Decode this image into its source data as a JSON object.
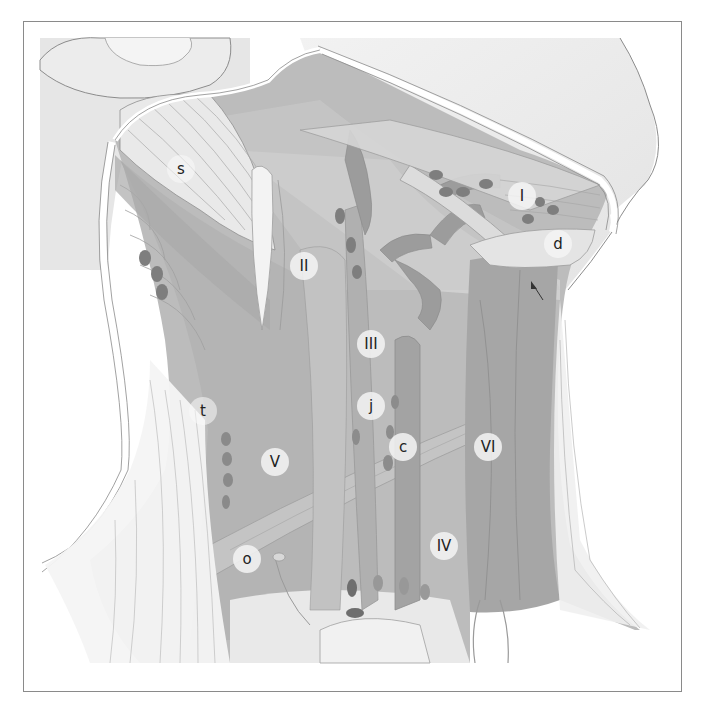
{
  "figure": {
    "labels": [
      {
        "id": "s",
        "text": "s",
        "x": 181,
        "y": 169
      },
      {
        "id": "I",
        "text": "I",
        "x": 522,
        "y": 196
      },
      {
        "id": "d",
        "text": "d",
        "x": 558,
        "y": 244
      },
      {
        "id": "II",
        "text": "II",
        "x": 304,
        "y": 266
      },
      {
        "id": "III",
        "text": "III",
        "x": 371,
        "y": 344
      },
      {
        "id": "t",
        "text": "t",
        "x": 203,
        "y": 411
      },
      {
        "id": "j",
        "text": "j",
        "x": 371,
        "y": 406
      },
      {
        "id": "c",
        "text": "c",
        "x": 403,
        "y": 447
      },
      {
        "id": "VI",
        "text": "VI",
        "x": 488,
        "y": 447
      },
      {
        "id": "V",
        "text": "V",
        "x": 275,
        "y": 462
      },
      {
        "id": "IV",
        "text": "IV",
        "x": 444,
        "y": 546
      },
      {
        "id": "o",
        "text": "o",
        "x": 247,
        "y": 559
      }
    ],
    "arrow": {
      "from": [
        541,
        298
      ],
      "to": [
        533,
        284
      ]
    },
    "colors": {
      "background": "#ffffff",
      "frame": "#8a8a8a",
      "skin": "#ededed",
      "muscle_light": "#d9d9d9",
      "muscle_mid": "#bdbdbd",
      "muscle_dark": "#a8a8a8",
      "vessel": "#9c9c9c",
      "node": "#7d7d7d",
      "outline": "#888888"
    }
  }
}
